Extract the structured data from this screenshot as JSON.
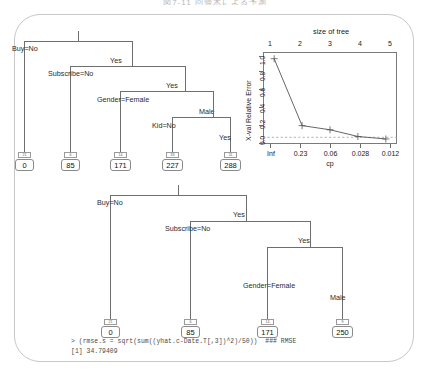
{
  "page": {
    "top_caption": "図7-11  回帰木による予測"
  },
  "tree1": {
    "name": "regression-tree-full",
    "splits": [
      {
        "id": "root-left",
        "label": "Buy=No"
      },
      {
        "id": "root-right",
        "label": "Yes"
      },
      {
        "id": "sub-left",
        "label": "Subscribe=No"
      },
      {
        "id": "sub-right",
        "label": "Yes"
      },
      {
        "id": "gender-left",
        "label": "Gender=Female"
      },
      {
        "id": "gender-right",
        "label": "Male"
      },
      {
        "id": "kid-left",
        "label": "Kid=No"
      },
      {
        "id": "kid-right",
        "label": "Yes"
      }
    ],
    "leaves": [
      {
        "value": "0",
        "count": "21"
      },
      {
        "value": "85",
        "count": "6"
      },
      {
        "value": "171",
        "count": "14"
      },
      {
        "value": "227",
        "count": "33"
      },
      {
        "value": "288",
        "count": "11"
      }
    ]
  },
  "tree2": {
    "name": "regression-tree-pruned",
    "splits": [
      {
        "id": "root-left",
        "label": "Buy=No"
      },
      {
        "id": "root-right",
        "label": "Yes"
      },
      {
        "id": "sub-left",
        "label": "Subscribe=No"
      },
      {
        "id": "sub-right",
        "label": "Yes"
      },
      {
        "id": "gender-left",
        "label": "Gender=Female"
      },
      {
        "id": "gender-right",
        "label": "Male"
      }
    ],
    "leaves": [
      {
        "value": "0",
        "count": "21"
      },
      {
        "value": "85",
        "count": "6"
      },
      {
        "value": "171",
        "count": "14"
      },
      {
        "value": "250",
        "count": "9"
      }
    ]
  },
  "console": {
    "line1": "> (rmse.s = sqrt(sum((yhat.c-Date.T[,3])^2)/50))  ### RMSE",
    "line2": "[1] 34.79409"
  },
  "chart_data": {
    "type": "line",
    "title": "size of tree",
    "xlabel": "cp",
    "ylabel": "X-val Relative Error",
    "x": [
      1,
      2,
      3,
      4,
      5
    ],
    "top_tick_labels": [
      "1",
      "2",
      "3",
      "4",
      "5"
    ],
    "bottom_tick_labels": [
      "Inf",
      "0.23",
      "0.06",
      "0.028",
      "0.012"
    ],
    "values": [
      1.0,
      0.2,
      0.15,
      0.07,
      0.04
    ],
    "ytick_labels": [
      "0.0",
      "0.2",
      "0.4",
      "0.6",
      "0.8",
      "1.0"
    ],
    "yticks": [
      0.0,
      0.2,
      0.4,
      0.6,
      0.8,
      1.0
    ],
    "ylim": [
      -0.02,
      1.08
    ],
    "xlim": [
      0.6,
      5.4
    ],
    "reference_line": 0.06,
    "reference_line_style": "dashed",
    "grid": false,
    "legend": null,
    "point_marker": "plus",
    "series_color": "#555555",
    "reference_color": "#7fa7c8"
  }
}
